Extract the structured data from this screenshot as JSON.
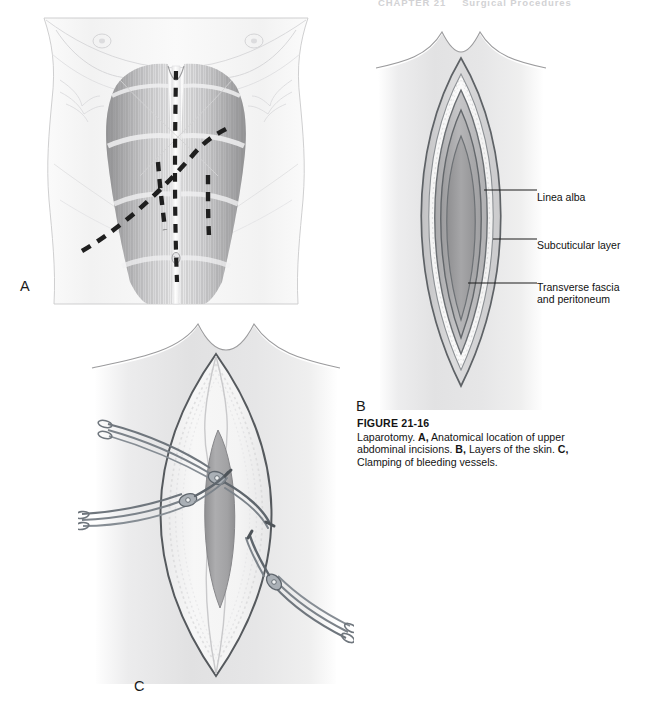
{
  "running_head": {
    "chapter": "CHAPTER 21",
    "title": "Surgical Procedures"
  },
  "figure": {
    "number_label": "FIGURE 21-16",
    "caption_lead": "Laparotomy. ",
    "part_a_marker": "A,",
    "part_a_text": " Anatomical location of upper abdominal incisions. ",
    "part_b_marker": "B,",
    "part_b_text": " Layers of the skin. ",
    "part_c_marker": "C,",
    "part_c_text": " Clamping of bleeding vessels."
  },
  "panels": [
    {
      "id": "A",
      "letter": "A",
      "description": "Anterior torso showing rectus abdominis muscles with dashed incision lines"
    },
    {
      "id": "B",
      "letter": "B",
      "description": "Cross-sectional lens-shaped view of abdominal wall tissue layers"
    },
    {
      "id": "C",
      "letter": "C",
      "description": "Open midline incision with three hemostat clamps on bleeding vessels"
    }
  ],
  "panel_b_labels": [
    {
      "id": "linea-alba",
      "text": "Linea alba"
    },
    {
      "id": "subcuticular-layer",
      "text": "Subcuticular layer"
    },
    {
      "id": "transverse-fascia",
      "text": "Transverse fascia",
      "text2": "and peritoneum"
    }
  ],
  "colors": {
    "page_background": "#ffffff",
    "ink": "#1a1a1a",
    "outline": "#5b5f63",
    "muscle_mid": "#9a9a9c",
    "tissue_light": "#d8d8d8",
    "tissue_mid": "#b4b4b4",
    "tissue_deep": "#9c9c9c",
    "instrument": "#7d838a",
    "running_head": "#d2d2d4"
  }
}
